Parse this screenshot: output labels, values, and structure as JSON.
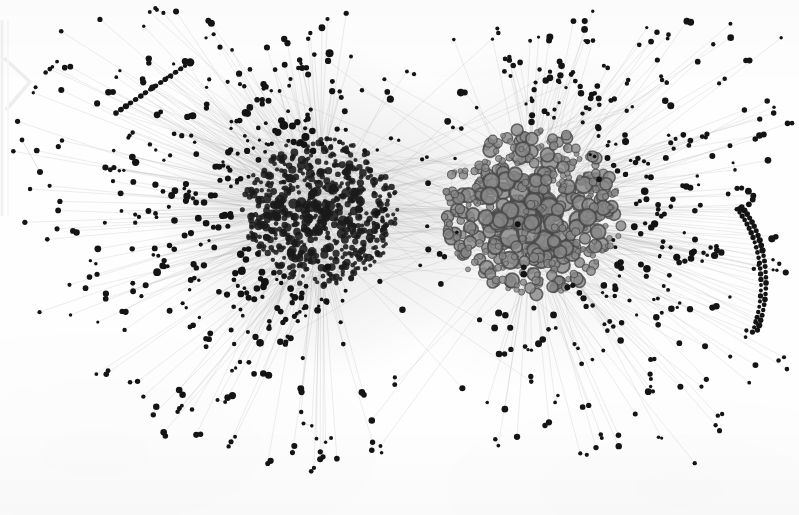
{
  "figure": {
    "kind": "network-graph",
    "medium": "scanned grayscale print",
    "background_color": "#fefefe",
    "width": 799,
    "height": 515
  },
  "chart_data": {
    "type": "scatter",
    "title": "",
    "subtitle": "",
    "xlabel": "",
    "ylabel": "",
    "grid": false,
    "legend_position": "none",
    "axis_visible": false,
    "tick_labels": [],
    "annotations": [],
    "layout_hints": {
      "xlim": [
        0,
        799
      ],
      "ylim": [
        0,
        515
      ],
      "edge_color": "#b9b9b9",
      "edge_width": 0.55,
      "edge_opacity": 0.5
    },
    "clusters": [
      {
        "name": "left-community",
        "center_x": 320,
        "center_y": 212,
        "core_radius": 78,
        "node_count": 620,
        "node_color": "#1d1d1d",
        "node_fill": "solid",
        "node_size_min": 2.0,
        "node_size_max": 5.5,
        "density": "very-high"
      },
      {
        "name": "right-community",
        "center_x": 532,
        "center_y": 212,
        "core_radius": 88,
        "node_count": 520,
        "node_color": "#5a5a5a",
        "node_fill": "ring",
        "node_size_min": 2.5,
        "node_size_max": 11.0,
        "density": "high"
      }
    ],
    "periphery": {
      "node_count": 560,
      "node_color": "#141414",
      "node_size_min": 1.6,
      "node_size_max": 3.4,
      "pair_fraction": 0.42,
      "description": "Small black leaf nodes, many occurring as connected dyads (dumbbells), attached to the cores by single long thin edges."
    },
    "features": [
      {
        "name": "bridge",
        "x": 430,
        "y": 212,
        "note": "narrow low-density corridor linking the two communities"
      },
      {
        "name": "isolated-dyad-left",
        "x": 22,
        "y": 140,
        "note": "detached pair of nodes at far left margin"
      },
      {
        "name": "node-arc-right",
        "x": 718,
        "y": 290,
        "note": "curved chain of peripheral nodes along right side"
      },
      {
        "name": "node-chain-upper-left",
        "x": 140,
        "y": 85,
        "note": "diagonal chain of peripheral nodes upper left"
      },
      {
        "name": "scan-artifact-left-edge",
        "x": 12,
        "y": 55,
        "note": "faint light-gray chevron from page scan"
      }
    ],
    "series": [
      {
        "name": "left-community-nodes",
        "marker": "filled-circle",
        "color": "#1d1d1d",
        "count": 620
      },
      {
        "name": "right-community-nodes",
        "marker": "ring-circle",
        "color": "#5a5a5a",
        "count": 520
      },
      {
        "name": "peripheral-nodes",
        "marker": "filled-circle",
        "color": "#141414",
        "count": 560
      },
      {
        "name": "edges",
        "marker": "line",
        "color": "#b9b9b9",
        "count": 2400
      }
    ]
  }
}
